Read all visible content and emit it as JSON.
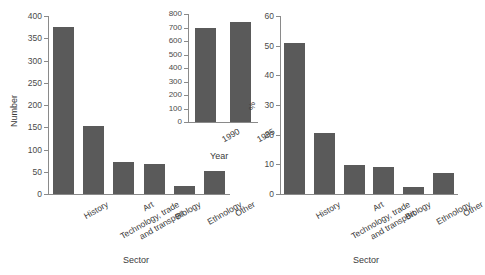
{
  "figure": {
    "background_color": "#ffffff",
    "bar_color": "#5a5a5a",
    "axis_color": "#8a8a8a"
  },
  "chart_data": [
    {
      "id": "panel-number",
      "type": "bar",
      "title": "",
      "xlabel": "Sector",
      "ylabel": "Number",
      "categories": [
        "History",
        "Technology, trade\nand transport",
        "Art",
        "Biology",
        "Ethnology",
        "Other"
      ],
      "values": [
        376,
        153,
        72,
        68,
        17,
        52
      ],
      "ylim": [
        0,
        400
      ],
      "yticks": [
        0,
        50,
        100,
        150,
        200,
        250,
        300,
        350,
        400
      ],
      "ytick_labels": [
        "0",
        "50",
        "100",
        "150",
        "200",
        "250",
        "300",
        "350",
        "400"
      ],
      "grid": false,
      "legend": "none"
    },
    {
      "id": "panel-percent",
      "type": "bar",
      "title": "",
      "xlabel": "Sector",
      "ylabel": "%",
      "categories": [
        "History",
        "Technology, trade\nand transport",
        "Art",
        "Biology",
        "Ethnology",
        "Other"
      ],
      "values": [
        50.9,
        20.7,
        9.8,
        9.2,
        2.3,
        7.0
      ],
      "ylim": [
        0,
        60
      ],
      "yticks": [
        0,
        10,
        20,
        30,
        40,
        50,
        60
      ],
      "ytick_labels": [
        "0",
        "10",
        "20",
        "30",
        "40",
        "50",
        "60"
      ],
      "grid": false,
      "legend": "none"
    },
    {
      "id": "inset-year",
      "type": "bar",
      "title": "",
      "xlabel": "Year",
      "ylabel": "",
      "categories": [
        "1990",
        "1995"
      ],
      "values": [
        695,
        738
      ],
      "ylim": [
        0,
        800
      ],
      "yticks": [
        0,
        100,
        200,
        300,
        400,
        500,
        600,
        700,
        800
      ],
      "ytick_labels": [
        "0",
        "100",
        "200",
        "300",
        "400",
        "500",
        "600",
        "700",
        "800"
      ],
      "grid": false,
      "legend": "none"
    }
  ]
}
